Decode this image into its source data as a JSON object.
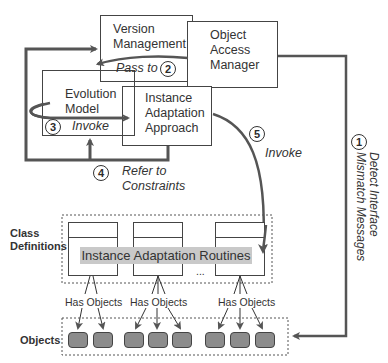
{
  "components": {
    "version_management": {
      "line1": "Version",
      "line2": "Management"
    },
    "object_access_manager": {
      "line1": "Object",
      "line2": "Access",
      "line3": "Manager"
    },
    "evolution_model": {
      "line1": "Evolution",
      "line2": "Model"
    },
    "instance_adaptation_approach": {
      "line1": "Instance",
      "line2": "Adaptation",
      "line3": "Approach"
    }
  },
  "steps": [
    {
      "num": "1",
      "label_line1": "Detect Interface",
      "label_line2": "Mismatch Messages"
    },
    {
      "num": "2",
      "label": "Pass to"
    },
    {
      "num": "3",
      "label": "Invoke"
    },
    {
      "num": "4",
      "label_line1": "Refer to",
      "label_line2": "Constraints"
    },
    {
      "num": "5",
      "label": "Invoke"
    }
  ],
  "layers": {
    "class_definitions": {
      "line1": "Class",
      "line2": "Definitions"
    },
    "objects": "Objects"
  },
  "instance_adaptation_routines": "Instance Adaptation Routines",
  "ellipsis": "...",
  "has_objects": [
    "Has Objects",
    "Has Objects",
    "Has Objects"
  ],
  "colors": {
    "line": "#555555",
    "object_fill": "#8c8c8c",
    "routine_bar": "#c9c9c9"
  }
}
